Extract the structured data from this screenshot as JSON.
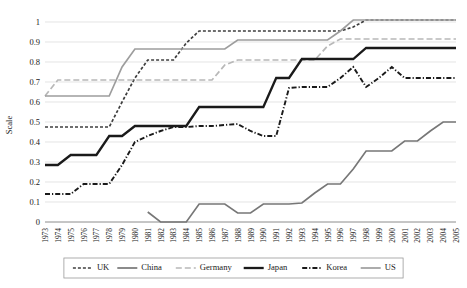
{
  "chart_data": {
    "type": "line",
    "title": "",
    "xlabel": "",
    "ylabel": "Scale",
    "ylim": [
      0,
      1
    ],
    "ytick_values": [
      0,
      0.1,
      0.2,
      0.3,
      0.4,
      0.5,
      0.6,
      0.7,
      0.8,
      0.9,
      1
    ],
    "ytick_labels": [
      "0",
      "0.1",
      "0.2",
      "0.3",
      "0.4",
      "0.5",
      "0.6",
      "0.7",
      "0.8",
      "0.9",
      "1"
    ],
    "grid": true,
    "legend_position": "bottom",
    "categories": [
      "1973",
      "1974",
      "1975",
      "1976",
      "1977",
      "1978",
      "1979",
      "1980",
      "1981",
      "1982",
      "1983",
      "1984",
      "1985",
      "1986",
      "1987",
      "1988",
      "1989",
      "1990",
      "1991",
      "1992",
      "1993",
      "1994",
      "1995",
      "1996",
      "1997",
      "1998",
      "1999",
      "2000",
      "2001",
      "2002",
      "2003",
      "2004",
      "2005"
    ],
    "series": [
      {
        "name": "UK",
        "color": "#3f3f3f",
        "width": 1.7,
        "dash": "3,2",
        "values": [
          0.475,
          0.475,
          0.475,
          0.475,
          0.475,
          0.475,
          0.6,
          0.72,
          0.81,
          0.81,
          0.81,
          0.895,
          0.955,
          0.955,
          0.955,
          0.955,
          0.955,
          0.955,
          0.955,
          0.955,
          0.955,
          0.955,
          0.955,
          0.955,
          0.975,
          1.01,
          1.01,
          1.01,
          1.01,
          1.01,
          1.01,
          1.01,
          1.01
        ]
      },
      {
        "name": "China",
        "color": "#777777",
        "width": 1.7,
        "dash": "",
        "values": [
          null,
          null,
          null,
          null,
          null,
          null,
          null,
          null,
          0.05,
          0.0,
          0.0,
          0.0,
          0.09,
          0.09,
          0.09,
          0.045,
          0.045,
          0.09,
          0.09,
          0.09,
          0.095,
          0.145,
          0.19,
          0.19,
          0.265,
          0.355,
          0.355,
          0.355,
          0.405,
          0.405,
          0.455,
          0.5,
          0.5
        ]
      },
      {
        "name": "Germany",
        "color": "#b8b8b8",
        "width": 1.7,
        "dash": "6,3",
        "values": [
          0.63,
          0.71,
          0.71,
          0.71,
          0.71,
          0.71,
          0.71,
          0.71,
          0.71,
          0.71,
          0.71,
          0.71,
          0.71,
          0.71,
          0.785,
          0.81,
          0.81,
          0.81,
          0.81,
          0.81,
          0.81,
          0.81,
          0.88,
          0.915,
          0.915,
          0.915,
          0.915,
          0.915,
          0.915,
          0.915,
          0.915,
          0.915,
          0.915
        ]
      },
      {
        "name": "Japan",
        "color": "#1a1a1a",
        "width": 2.3,
        "dash": "",
        "values": [
          0.285,
          0.285,
          0.335,
          0.335,
          0.335,
          0.43,
          0.43,
          0.48,
          0.48,
          0.48,
          0.48,
          0.48,
          0.575,
          0.575,
          0.575,
          0.575,
          0.575,
          0.575,
          0.72,
          0.72,
          0.815,
          0.815,
          0.815,
          0.815,
          0.815,
          0.87,
          0.87,
          0.87,
          0.87,
          0.87,
          0.87,
          0.87,
          0.87
        ]
      },
      {
        "name": "Korea",
        "color": "#1a1a1a",
        "width": 1.9,
        "dash": "5,2,1.2,2",
        "values": [
          0.14,
          0.14,
          0.14,
          0.19,
          0.19,
          0.19,
          0.285,
          0.4,
          0.43,
          0.455,
          0.475,
          0.475,
          0.48,
          0.48,
          0.485,
          0.49,
          0.455,
          0.43,
          0.43,
          0.67,
          0.675,
          0.675,
          0.675,
          0.72,
          0.775,
          0.675,
          0.72,
          0.775,
          0.72,
          0.72,
          0.72,
          0.72,
          0.72
        ]
      },
      {
        "name": "US",
        "color": "#9d9d9d",
        "width": 1.7,
        "dash": "",
        "values": [
          0.63,
          0.63,
          0.63,
          0.63,
          0.63,
          0.63,
          0.775,
          0.865,
          0.865,
          0.865,
          0.865,
          0.865,
          0.865,
          0.865,
          0.865,
          0.91,
          0.91,
          0.91,
          0.91,
          0.91,
          0.91,
          0.91,
          0.91,
          0.955,
          1.01,
          1.01,
          1.01,
          1.01,
          1.01,
          1.01,
          1.01,
          1.01,
          1.01
        ]
      }
    ]
  },
  "legend": {
    "items": [
      {
        "label": "UK"
      },
      {
        "label": "China"
      },
      {
        "label": "Germany"
      },
      {
        "label": "Japan"
      },
      {
        "label": "Korea"
      },
      {
        "label": "US"
      }
    ]
  }
}
